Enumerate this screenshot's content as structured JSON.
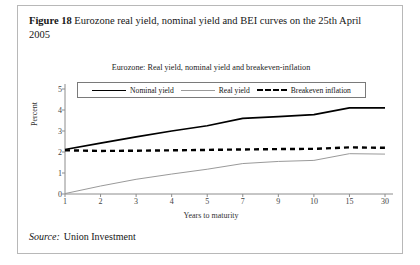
{
  "figure": {
    "label": "Figure 18",
    "caption": "Eurozone real yield, nominal yield and BEI curves on the 25th April 2005"
  },
  "source": {
    "word": "Source:",
    "value": "Union Investment"
  },
  "legend": {
    "nominal": "Nominal yield",
    "real": "Real yield",
    "bei": "Breakeven inflation"
  },
  "colors": {
    "nominal": "#000000",
    "real": "#9a9a9a",
    "bei": "#000000",
    "axis": "#8c8c8c",
    "frame": "#b8b8b8"
  },
  "chart_data": {
    "type": "line",
    "title": "Eurozone: Real yield, nominal yield and breakeven-inflation",
    "xlabel": "Years to maturity",
    "ylabel": "Percent",
    "categories": [
      "1",
      "2",
      "3",
      "4",
      "5",
      "7",
      "9",
      "10",
      "15",
      "30"
    ],
    "yticks": [
      0,
      1,
      2,
      3,
      4,
      5
    ],
    "ylim": [
      0,
      5
    ],
    "grid": false,
    "legend_position": "top-center",
    "series": [
      {
        "name": "Nominal yield",
        "style": "solid-thick",
        "color": "#000000",
        "values": [
          2.12,
          2.42,
          2.72,
          3.0,
          3.25,
          3.6,
          3.68,
          3.78,
          4.1,
          4.1
        ]
      },
      {
        "name": "Real yield",
        "style": "solid-thin",
        "color": "#9a9a9a",
        "values": [
          0.02,
          0.38,
          0.7,
          0.95,
          1.18,
          1.45,
          1.55,
          1.6,
          1.92,
          1.9
        ]
      },
      {
        "name": "Breakeven inflation",
        "style": "dashed-thick",
        "color": "#000000",
        "values": [
          2.08,
          2.05,
          2.06,
          2.08,
          2.1,
          2.12,
          2.14,
          2.15,
          2.22,
          2.2
        ]
      }
    ]
  }
}
